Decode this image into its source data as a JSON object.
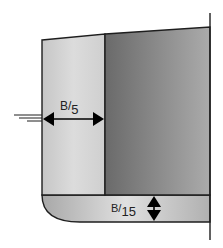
{
  "diagram": {
    "colors": {
      "background": "#ffffff",
      "outline": "#1e1e1e",
      "side_tank_light": "#d2d2d2",
      "side_tank_highlight": "#e2e2e2",
      "cargo_dark_left": "#6a6a6a",
      "cargo_dark_right": "#ababab",
      "bottom_edge": "#a8a8a8",
      "bottom_center": "#e0e0e0",
      "arrow": "#000000"
    },
    "labels": {
      "side_width": {
        "num": "B",
        "den": "5"
      },
      "bottom_height": {
        "num": "B",
        "den": "15"
      }
    },
    "elements": {
      "waterline": "waterline-marker",
      "side_arrow": "horizontal-double-arrow",
      "bottom_arrow": "vertical-double-arrow",
      "centerline": "centerline-vertical"
    }
  }
}
